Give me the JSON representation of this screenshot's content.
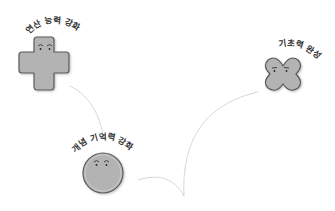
{
  "diagram": {
    "nodes": [
      {
        "id": "calc",
        "label": "연산 능력 강화",
        "shape": "cross",
        "face": "smiling-eyes"
      },
      {
        "id": "concept",
        "label": "개념 기억력 강화",
        "shape": "circle",
        "face": "smiling-eyes"
      },
      {
        "id": "basic",
        "label": "기초력 완성",
        "shape": "clover",
        "face": "flat-eyes"
      }
    ],
    "edges": [
      {
        "from": "calc",
        "to": "concept",
        "style": "thin-gray-curve"
      },
      {
        "from": "concept",
        "to": "basic",
        "style": "thin-gray-curve"
      }
    ],
    "colors": {
      "shape_fill": "#b3b3b3",
      "shape_stroke": "#555555",
      "line": "#b0b0b0",
      "text": "#333333"
    }
  }
}
